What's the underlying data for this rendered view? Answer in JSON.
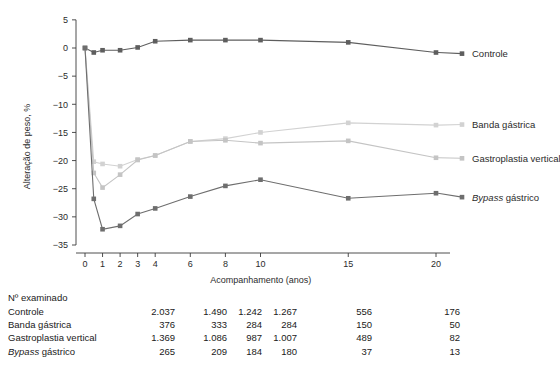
{
  "chart_data": {
    "type": "line",
    "title": "",
    "xlabel": "Acompanhamento (anos)",
    "ylabel": "Alteração de peso, %",
    "xlim": [
      -0.35,
      21.0
    ],
    "ylim": [
      -36.5,
      6.5
    ],
    "xticks": [
      0,
      1,
      2,
      3,
      4,
      6,
      8,
      10,
      15,
      20
    ],
    "xtick_labels": [
      "0",
      "1",
      "2",
      "3",
      "4",
      "6",
      "8",
      "10",
      "15",
      "20"
    ],
    "yticks": [
      5,
      0,
      -5,
      -10,
      -15,
      -20,
      -25,
      -30,
      -35
    ],
    "ytick_labels": [
      "5",
      "0",
      "−5",
      "−10",
      "−15",
      "−20",
      "−25",
      "−30",
      "−35"
    ],
    "grid": false,
    "legend_position": "right",
    "series": [
      {
        "name": "Controle",
        "color": "#5e5e5e",
        "legend_y": -1.0,
        "x": [
          0,
          0.5,
          1,
          2,
          3,
          4,
          6,
          8,
          10,
          15,
          20
        ],
        "values": [
          0.0,
          -0.8,
          -0.4,
          -0.4,
          0.1,
          1.2,
          1.4,
          1.4,
          1.4,
          1.0,
          -0.8
        ]
      },
      {
        "name": "Banda gástrica",
        "color": "#d2d2d2",
        "legend_y": -13.6,
        "x": [
          0,
          0.5,
          1,
          2,
          3,
          4,
          6,
          8,
          10,
          15,
          20
        ],
        "values": [
          0.0,
          -20.2,
          -20.6,
          -21.0,
          -19.8,
          -19.1,
          -16.6,
          -16.1,
          -15.0,
          -13.3,
          -13.7
        ]
      },
      {
        "name": "Gastroplastia vertical",
        "color": "#c4c4c4",
        "legend_y": -19.6,
        "x": [
          0,
          0.5,
          1,
          2,
          3,
          4,
          6,
          8,
          10,
          15,
          20
        ],
        "values": [
          0.0,
          -22.2,
          -24.8,
          -22.5,
          -19.9,
          -19.1,
          -16.6,
          -16.4,
          -16.9,
          -16.5,
          -19.5
        ]
      },
      {
        "name": "Bypass gástrico",
        "color": "#6e6e6e",
        "legend_y": -26.5,
        "legend_italic_prefix": "Bypass",
        "legend_rest": " gástrico",
        "x": [
          0,
          0.5,
          1,
          2,
          3,
          4,
          6,
          8,
          10,
          15,
          20
        ],
        "values": [
          0.0,
          -26.8,
          -32.2,
          -31.6,
          -29.5,
          -28.5,
          -26.4,
          -24.5,
          -23.4,
          -26.7,
          -25.8
        ]
      }
    ]
  },
  "counts_table": {
    "title": "Nº examinado",
    "column_x": [
      0,
      1,
      2,
      3,
      4,
      6,
      8,
      10,
      15,
      20
    ],
    "rows": [
      {
        "label": "Controle",
        "italic_prefix": "",
        "values": [
          "2.037",
          "1.490",
          "",
          "1.242",
          "1.267",
          "",
          "556",
          "",
          "176"
        ]
      },
      {
        "label": "Banda gástrica",
        "italic_prefix": "",
        "values": [
          "376",
          "333",
          "",
          "284",
          "284",
          "",
          "150",
          "",
          "50"
        ]
      },
      {
        "label": "Gastroplastia vertical",
        "italic_prefix": "",
        "values": [
          "1.369",
          "1.086",
          "",
          "987",
          "1.007",
          "",
          "489",
          "",
          "82"
        ]
      },
      {
        "label": "Bypass gástrico",
        "italic_prefix": "Bypass",
        "label_rest": " gástrico",
        "values": [
          "265",
          "209",
          "",
          "184",
          "180",
          "",
          "37",
          "",
          "13"
        ]
      }
    ],
    "value_columns_px": [
      175,
      227,
      262,
      297,
      372,
      460
    ]
  },
  "colors": {
    "axis": "#3b3b3b",
    "text": "#1a1a1a",
    "control": "#5e5e5e",
    "band": "#d2d2d2",
    "gastroplasty": "#c4c4c4",
    "bypass": "#6e6e6e"
  }
}
